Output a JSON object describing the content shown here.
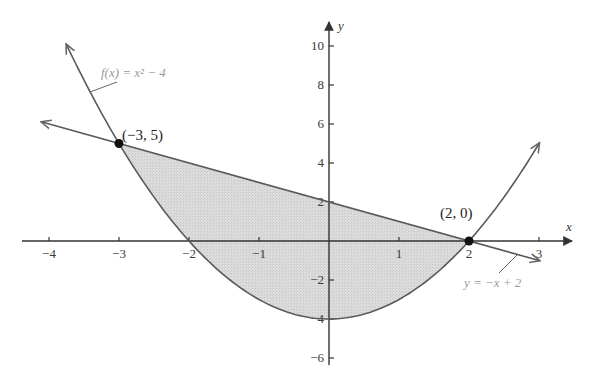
{
  "chart_data": {
    "type": "line",
    "title": "",
    "xlabel": "x",
    "ylabel": "y",
    "xlim": [
      -4.4,
      3.5
    ],
    "ylim": [
      -6.4,
      11.2
    ],
    "x_ticks": [
      -4,
      -3,
      -2,
      -1,
      1,
      2,
      3
    ],
    "x_tick_labels": [
      "−4",
      "−3",
      "−2",
      "−1",
      "1",
      "2",
      "3"
    ],
    "y_ticks": [
      -6,
      -4,
      -2,
      2,
      4,
      6,
      8,
      10
    ],
    "y_tick_labels": [
      "−6",
      "−4",
      "−2",
      "2",
      "4",
      "6",
      "8",
      "10"
    ],
    "grid": false,
    "series": [
      {
        "name": "f(x) = x² − 4",
        "kind": "parabola",
        "formula": "x^2 - 4",
        "x_range": [
          -3.75,
          3.0
        ],
        "label": "f(x) = x² − 4",
        "color": "#555555",
        "arrows": true
      },
      {
        "name": "y = −x + 2",
        "kind": "line",
        "formula": "-x + 2",
        "x_range": [
          -4.1,
          3.0
        ],
        "label": "y = −x + 2",
        "color": "#555555",
        "arrows": true
      }
    ],
    "shaded_region": {
      "between": [
        "y = −x + 2",
        "f(x) = x² − 4"
      ],
      "x_range": [
        -3,
        2
      ],
      "fill": "#d9d9d9"
    },
    "points": [
      {
        "x": -3,
        "y": 5,
        "label": "(−3, 5)"
      },
      {
        "x": 2,
        "y": 0,
        "label": "(2, 0)"
      }
    ]
  }
}
